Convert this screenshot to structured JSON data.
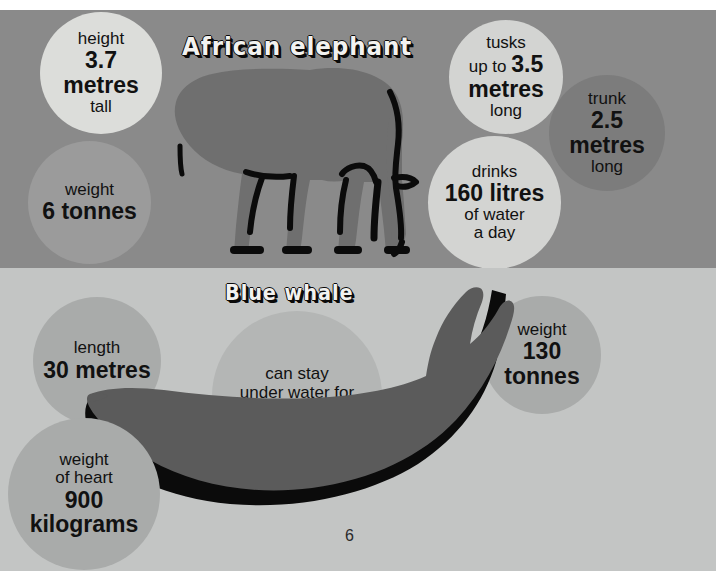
{
  "page": {
    "page_number": "6",
    "background_color": "#ffffff"
  },
  "sections": [
    {
      "id": "african-elephant",
      "title": "African elephant",
      "background_color": "#8a8a8a",
      "animal_icon": "elephant-silhouette",
      "facts": [
        {
          "id": "height",
          "color": "#dcddda",
          "lines": [
            {
              "text": "height",
              "style": "sm"
            },
            {
              "text": "3.7",
              "style": "bg"
            },
            {
              "text": "metres",
              "style": "bg"
            },
            {
              "text": "tall",
              "style": "sm"
            }
          ]
        },
        {
          "id": "weight",
          "color": "#9b9b9b",
          "lines": [
            {
              "text": "weight",
              "style": "sm"
            },
            {
              "text": "6 tonnes",
              "style": "bg"
            }
          ]
        },
        {
          "id": "tusks",
          "color": "#d3d4d2",
          "lines": [
            {
              "text": "tusks",
              "style": "sm"
            },
            {
              "text": "up to 3.5",
              "style": "mix",
              "bold_part": "3.5",
              "plain_part": "up to "
            },
            {
              "text": "metres",
              "style": "bg"
            },
            {
              "text": "long",
              "style": "sm"
            }
          ]
        },
        {
          "id": "drinks",
          "color": "#d3d4d2",
          "lines": [
            {
              "text": "drinks",
              "style": "sm"
            },
            {
              "text": "160 litres",
              "style": "bg"
            },
            {
              "text": "of water",
              "style": "sm"
            },
            {
              "text": "a day",
              "style": "sm"
            }
          ]
        },
        {
          "id": "trunk",
          "color": "#7c7c7c",
          "lines": [
            {
              "text": "trunk",
              "style": "sm"
            },
            {
              "text": "2.5",
              "style": "bg"
            },
            {
              "text": "metres",
              "style": "bg"
            },
            {
              "text": "long",
              "style": "sm"
            }
          ]
        }
      ]
    },
    {
      "id": "blue-whale",
      "title": "Blue whale",
      "background_color": "#c3c5c4",
      "animal_icon": "whale-silhouette",
      "facts": [
        {
          "id": "length",
          "color": "#a9abaa",
          "lines": [
            {
              "text": "length",
              "style": "sm"
            },
            {
              "text": "30 metres",
              "style": "bg"
            }
          ]
        },
        {
          "id": "breath-hold",
          "color": "#b4b6b5",
          "lines": [
            {
              "text": "can stay",
              "style": "sm"
            },
            {
              "text": "under water for",
              "style": "sm"
            },
            {
              "text": "1.5 hours",
              "style": "bg"
            }
          ]
        },
        {
          "id": "weight",
          "color": "#a9abaa",
          "lines": [
            {
              "text": "weight",
              "style": "sm"
            },
            {
              "text": "130",
              "style": "bg"
            },
            {
              "text": "tonnes",
              "style": "bg"
            }
          ]
        },
        {
          "id": "heart-weight",
          "color": "#a9abaa",
          "lines": [
            {
              "text": "weight",
              "style": "sm"
            },
            {
              "text": "of heart",
              "style": "sm"
            },
            {
              "text": "900",
              "style": "bg"
            },
            {
              "text": "kilograms",
              "style": "bg"
            }
          ]
        }
      ]
    }
  ]
}
